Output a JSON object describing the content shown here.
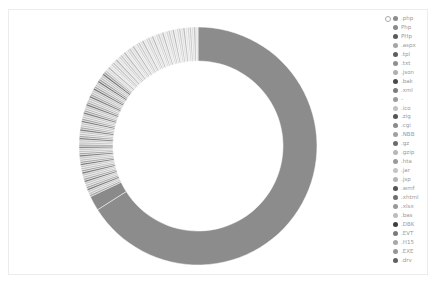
{
  "chart_data": {
    "type": "pie",
    "variant": "donut",
    "title": "",
    "legend_position": "right",
    "center": [
      198,
      146
    ],
    "outer_radius": 119,
    "inner_radius": 85,
    "start_angle_deg": 0,
    "direction": "clockwise",
    "categories": [
      ".php",
      "Php",
      "PHp",
      ".aspx",
      ".tpl",
      ".txt",
      ".json",
      ".bak",
      ".xml",
      "-",
      ".ico",
      ".zig",
      ".cgi",
      ".NBB",
      ".gz",
      ".gzip",
      ".hta",
      ".jar",
      ".jsp",
      ".wmf",
      ".xhtml",
      ".xlsx",
      ".bas",
      ".DBK",
      ".EVT",
      ".H15",
      ".EXE",
      ".drv"
    ],
    "major_slices": [
      {
        "name": ".php",
        "percent": 66.0,
        "color": "#8c8c8c"
      },
      {
        "name": "Php",
        "percent": 2.0,
        "color": "#8a8a8a"
      }
    ],
    "minor_slice_count": 110,
    "minor_slices_percent_total": 32.0,
    "note": "Many thin slices (~0.3% each) fill the remaining arc in alternating gray shades"
  },
  "legend": {
    "toggle_icon": "circle-outline",
    "items": [
      {
        "label": ".php",
        "color": "#8c8c8c"
      },
      {
        "label": "Php",
        "color": "#8a8a8a"
      },
      {
        "label": "PHp",
        "color": "#5a5a5a"
      },
      {
        "label": ".aspx",
        "color": "#a5a5a5"
      },
      {
        "label": ".tpl",
        "color": "#5e5e5e"
      },
      {
        "label": ".txt",
        "color": "#8f8f8f"
      },
      {
        "label": ".json",
        "color": "#b0b0b0"
      },
      {
        "label": ".bak",
        "color": "#4a4a4a"
      },
      {
        "label": ".xml",
        "color": "#7d7d7d"
      },
      {
        "label": "-",
        "color": "#9c9c9c"
      },
      {
        "label": ".ico",
        "color": "#c2c2c2"
      },
      {
        "label": ".zig",
        "color": "#555555"
      },
      {
        "label": ".cgi",
        "color": "#8b8b8b"
      },
      {
        "label": ".NBB",
        "color": "#a0a0a0"
      },
      {
        "label": ".gz",
        "color": "#6b6b6b"
      },
      {
        "label": ".gzip",
        "color": "#b8b8b8"
      },
      {
        "label": ".hta",
        "color": "#9a9a9a"
      },
      {
        "label": ".jar",
        "color": "#c4c4c4"
      },
      {
        "label": ".jsp",
        "color": "#b5b5b5"
      },
      {
        "label": ".wmf",
        "color": "#555555"
      },
      {
        "label": ".xhtml",
        "color": "#6f6f6f"
      },
      {
        "label": ".xlsx",
        "color": "#999999"
      },
      {
        "label": ".bas",
        "color": "#bdbdbd"
      },
      {
        "label": ".DBK",
        "color": "#3f3f3f"
      },
      {
        "label": ".EVT",
        "color": "#7a7a7a"
      },
      {
        "label": ".H15",
        "color": "#a8a8a8"
      },
      {
        "label": ".EXE",
        "color": "#969696"
      },
      {
        "label": ".drv",
        "color": "#606060"
      }
    ]
  }
}
